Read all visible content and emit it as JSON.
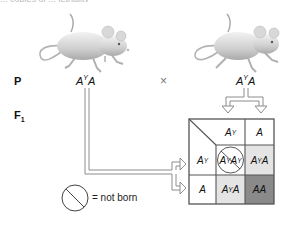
{
  "caption_partial": "... copies of ... lethality",
  "parents": {
    "generation_label": "P",
    "left": {
      "allele1": "A",
      "allele1_sup": "Y",
      "allele2": "A",
      "image": "mouse-icon"
    },
    "cross_symbol": "×",
    "right": {
      "allele1": "A",
      "allele1_sup": "Y",
      "allele2": "A",
      "image": "mouse-icon"
    }
  },
  "offspring": {
    "generation_label": "F",
    "generation_sub": "1"
  },
  "punnett_square": {
    "column_headers": [
      {
        "allele": "A",
        "sup": "Y"
      },
      {
        "allele": "A",
        "sup": ""
      }
    ],
    "row_headers": [
      {
        "allele": "A",
        "sup": "Y"
      },
      {
        "allele": "A",
        "sup": ""
      }
    ],
    "cells": [
      [
        {
          "a1": "A",
          "s1": "Y",
          "a2": "A",
          "s2": "Y",
          "fill": "#ffffff",
          "not_born": true
        },
        {
          "a1": "A",
          "s1": "Y",
          "a2": "A",
          "s2": "",
          "fill": "#e4e4e4",
          "not_born": false
        }
      ],
      [
        {
          "a1": "A",
          "s1": "Y",
          "a2": "A",
          "s2": "",
          "fill": "#e4e4e4",
          "not_born": false
        },
        {
          "a1": "A",
          "s1": "",
          "a2": "A",
          "s2": "",
          "fill": "#8a8a8a",
          "not_born": false
        }
      ]
    ],
    "border_color": "#555555"
  },
  "legend": {
    "icon": "not-born-icon",
    "text": "= not born"
  }
}
